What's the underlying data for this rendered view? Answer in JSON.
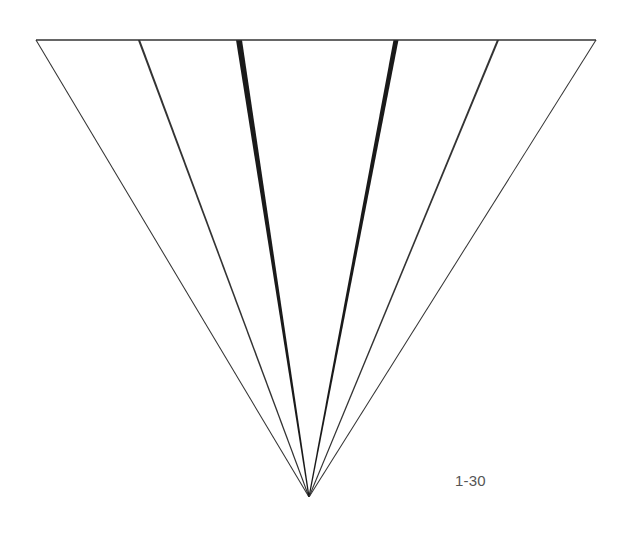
{
  "figure": {
    "label": "1-30"
  },
  "geometry": {
    "top_edge": {
      "x1": 36,
      "y": 40,
      "x2": 596
    },
    "apex": {
      "x": 309,
      "y": 497
    },
    "lines": [
      {
        "name": "outer-left-line",
        "top_x": 36,
        "weight": 1.2
      },
      {
        "name": "inner-left-line",
        "top_x": 139,
        "weight": 2.2
      },
      {
        "name": "thick-left-line",
        "top_x": 239,
        "weight": 6
      },
      {
        "name": "thick-right-line",
        "top_x": 396,
        "weight": 5
      },
      {
        "name": "inner-right-line",
        "top_x": 498,
        "weight": 2.2
      },
      {
        "name": "outer-right-line",
        "top_x": 596,
        "weight": 1.2
      }
    ]
  },
  "colors": {
    "stroke": "#1a1a1a",
    "thin_stroke": "#333333",
    "label": "#555555",
    "background": "#ffffff"
  }
}
